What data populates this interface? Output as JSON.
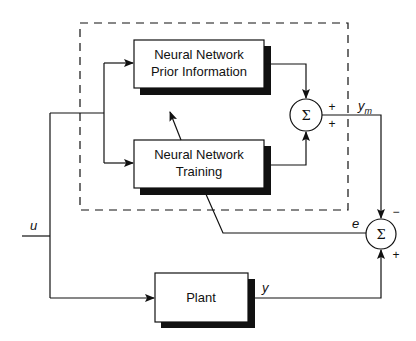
{
  "diagram": {
    "blocks": {
      "prior": {
        "line1": "Neural Network",
        "line2": "Prior Information"
      },
      "training": {
        "line1": "Neural Network",
        "line2": "Training"
      },
      "plant": {
        "label": "Plant"
      }
    },
    "summers": {
      "upper": {
        "symbol": "Σ",
        "sign_top": "+",
        "sign_bottom": "+"
      },
      "lower": {
        "symbol": "Σ",
        "sign_top": "−",
        "sign_bottom": "+"
      }
    },
    "signals": {
      "u": "u",
      "y": "y",
      "ym_base": "y",
      "ym_sub": "m",
      "e": "e"
    },
    "colors": {
      "line": "#111111",
      "shadow": "#111111",
      "background": "#ffffff"
    }
  }
}
